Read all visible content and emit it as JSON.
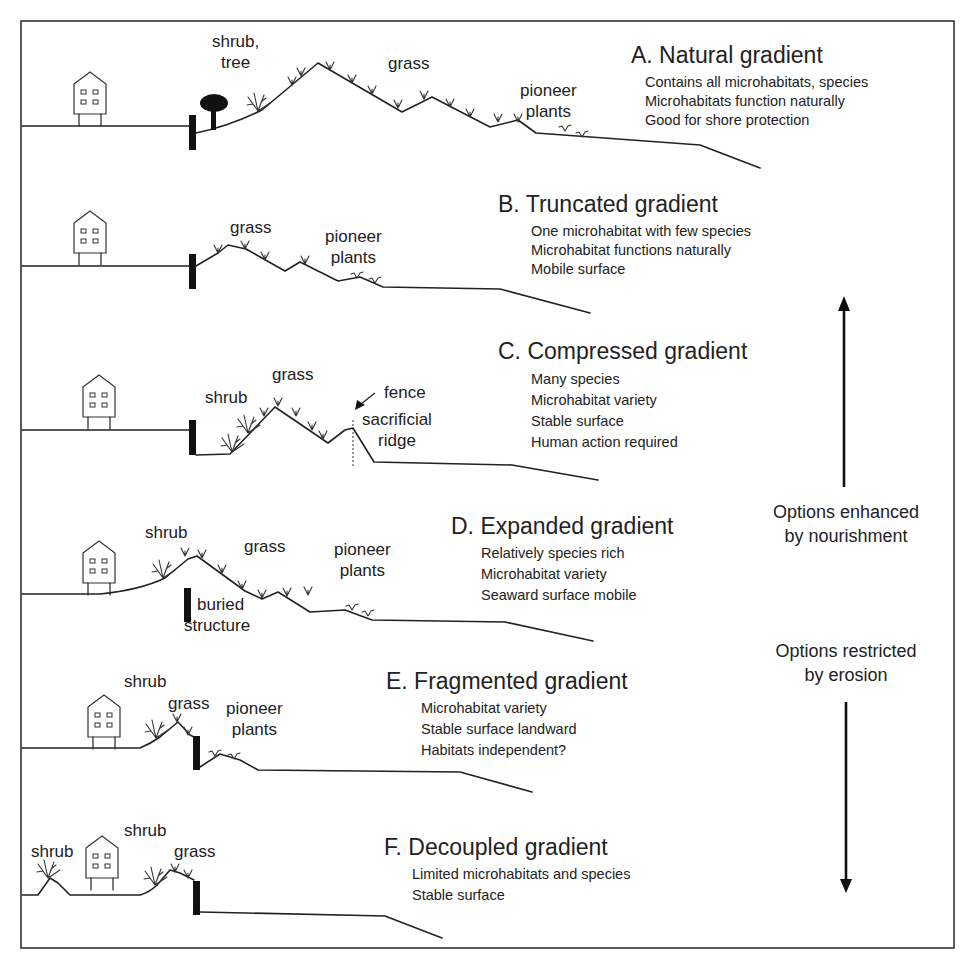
{
  "figure": {
    "frame": {
      "stroke": "#333333"
    },
    "panels": [
      {
        "id": "A",
        "title": "A. Natural gradient",
        "descriptions": [
          "Contains all microhabitats, species",
          "Microhabitats function naturally",
          "Good for shore protection"
        ],
        "labels": {
          "shrub_tree_1": "shrub,",
          "shrub_tree_2": "tree",
          "grass": "grass",
          "pioneer_1": "pioneer",
          "pioneer_2": "plants"
        }
      },
      {
        "id": "B",
        "title": "B. Truncated gradient",
        "descriptions": [
          "One microhabitat with few species",
          "Microhabitat functions naturally",
          "Mobile surface"
        ],
        "labels": {
          "grass": "grass",
          "pioneer_1": "pioneer",
          "pioneer_2": "plants"
        }
      },
      {
        "id": "C",
        "title": "C. Compressed gradient",
        "descriptions": [
          "Many species",
          "Microhabitat variety",
          "Stable surface",
          "Human action required"
        ],
        "labels": {
          "shrub": "shrub",
          "grass": "grass",
          "fence": "fence",
          "ridge_1": "sacrificial",
          "ridge_2": "ridge"
        }
      },
      {
        "id": "D",
        "title": "D. Expanded gradient",
        "descriptions": [
          "Relatively species rich",
          "Microhabitat variety",
          "Seaward surface mobile"
        ],
        "labels": {
          "shrub": "shrub",
          "grass": "grass",
          "pioneer_1": "pioneer",
          "pioneer_2": "plants",
          "buried_1": "buried",
          "buried_2": "structure"
        }
      },
      {
        "id": "E",
        "title": "E. Fragmented gradient",
        "descriptions": [
          "Microhabitat variety",
          "Stable surface landward",
          "Habitats independent?"
        ],
        "labels": {
          "shrub": "shrub",
          "grass": "grass",
          "pioneer_1": "pioneer",
          "pioneer_2": "plants"
        }
      },
      {
        "id": "F",
        "title": "F. Decoupled gradient",
        "descriptions": [
          "Limited microhabitats and species",
          "Stable surface"
        ],
        "labels": {
          "shrub_left": "shrub",
          "shrub": "shrub",
          "grass": "grass"
        }
      }
    ],
    "side_arrows": {
      "up": {
        "label_1": "Options enhanced",
        "label_2": "by nourishment",
        "icon": "arrow-up-icon"
      },
      "down": {
        "label_1": "Options restricted",
        "label_2": "by erosion",
        "icon": "arrow-down-icon"
      }
    }
  }
}
